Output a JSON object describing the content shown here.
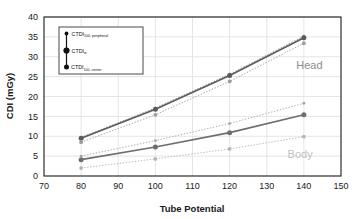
{
  "chart_data": {
    "type": "line",
    "title": "",
    "xlabel": "Tube Potential",
    "ylabel": "CDI (mGy)",
    "xlim": [
      70,
      150
    ],
    "ylim": [
      0,
      40
    ],
    "xticks": [
      "70",
      "80",
      "90",
      "100",
      "110",
      "120",
      "130",
      "140",
      "150"
    ],
    "yticks": [
      "0",
      "5",
      "10",
      "15",
      "20",
      "25",
      "30",
      "35",
      "40"
    ],
    "grid": true,
    "legend_position": "upper-left-inset",
    "x": [
      80,
      100,
      120,
      140
    ],
    "series": [
      {
        "name": "Head CTDI100,peripheral",
        "group": "Head",
        "measure": "CTDI100,peripheral",
        "values": [
          9.7,
          17.1,
          25.6,
          35.2
        ],
        "color": "#8a8a8a",
        "linestyle": "dotted",
        "marker": "small"
      },
      {
        "name": "Head CTDIw",
        "group": "Head",
        "measure": "CTDIw",
        "values": [
          9.5,
          16.8,
          25.3,
          34.8
        ],
        "color": "#5b5b5b",
        "linestyle": "solid",
        "marker": "large"
      },
      {
        "name": "Head CTDI100,center",
        "group": "Head",
        "measure": "CTDI100,center",
        "values": [
          8.5,
          15.4,
          23.8,
          33.4
        ],
        "color": "#9c9c9c",
        "linestyle": "dotted",
        "marker": "medium"
      },
      {
        "name": "Body CTDI100,peripheral",
        "group": "Body",
        "measure": "CTDI100,peripheral",
        "values": [
          5.0,
          8.9,
          13.2,
          18.3
        ],
        "color": "#a6a6a6",
        "linestyle": "dotted",
        "marker": "small"
      },
      {
        "name": "Body CTDIw",
        "group": "Body",
        "measure": "CTDIw",
        "values": [
          4.1,
          7.3,
          10.9,
          15.4
        ],
        "color": "#6e6e6e",
        "linestyle": "solid",
        "marker": "large"
      },
      {
        "name": "Body CTDI100,center",
        "group": "Body",
        "measure": "CTDI100,center",
        "values": [
          2.0,
          4.3,
          6.8,
          9.9
        ],
        "color": "#b4b4b4",
        "linestyle": "dotted",
        "marker": "medium"
      }
    ],
    "annotations": [
      {
        "text": "Head",
        "x": 141.5,
        "y": 27.0,
        "color": "#8c8c8c"
      },
      {
        "text": "Body",
        "x": 139.0,
        "y": 4.6,
        "color": "#c2c2c2"
      }
    ],
    "legend_entries": [
      {
        "base": "CTDI",
        "sub": "100, peripheral",
        "marker": "small"
      },
      {
        "base": "CTDI",
        "sub": "w",
        "marker": "large"
      },
      {
        "base": "CTDI",
        "sub": "100, center",
        "marker": "medium"
      }
    ]
  },
  "colors": {
    "axis": "#1a1a1a",
    "grid": "#dedede",
    "text": "#1a1a1a",
    "legend_border": "#4a4a4a",
    "background": "#ffffff"
  }
}
